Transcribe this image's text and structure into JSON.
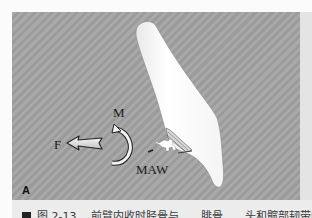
{
  "figure": {
    "panel_letter": "A",
    "labels": {
      "moment": "M",
      "force": "F",
      "attachment": "MAW"
    },
    "icons": [
      "bone-shape",
      "force-arrow-icon",
      "moment-arc-arrow-icon",
      "muscle-attachment-hatch-icon",
      "animal-silhouette-icon"
    ],
    "colors": {
      "panel_background": "#a3a3a3",
      "bone": "#ffffff",
      "caption_band": "#ececec",
      "text": "#1a1a1a"
    }
  },
  "caption": {
    "bullet": "■",
    "text": "图 2-13 　前臂内收时胫骨与……腓骨……头和髋部韧带的连接"
  }
}
